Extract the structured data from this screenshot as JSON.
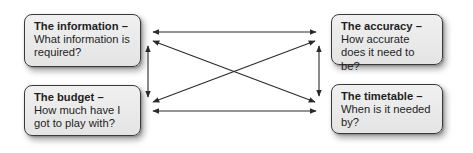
{
  "diagram": {
    "type": "relationship-diagram",
    "nodes": [
      {
        "id": "information",
        "title": "The information –",
        "body": "What information is required?",
        "position": "top-left"
      },
      {
        "id": "accuracy",
        "title": "The accuracy –",
        "body": "How accurate does it need to be?",
        "position": "top-right"
      },
      {
        "id": "budget",
        "title": "The budget –",
        "body": "How much have I got to play with?",
        "position": "bottom-left"
      },
      {
        "id": "timetable",
        "title": "The timetable –",
        "body": "When is it needed by?",
        "position": "bottom-right"
      }
    ],
    "edges": [
      {
        "from": "information",
        "to": "accuracy",
        "direction": "both"
      },
      {
        "from": "information",
        "to": "budget",
        "direction": "both"
      },
      {
        "from": "information",
        "to": "timetable",
        "direction": "both"
      },
      {
        "from": "accuracy",
        "to": "budget",
        "direction": "both"
      },
      {
        "from": "accuracy",
        "to": "timetable",
        "direction": "both"
      },
      {
        "from": "budget",
        "to": "timetable",
        "direction": "both"
      }
    ],
    "colors": {
      "box_fill": "#e9e9e9",
      "box_border": "#3a3a3a",
      "arrow": "#2a2a2a",
      "text": "#1e1e1e"
    }
  }
}
